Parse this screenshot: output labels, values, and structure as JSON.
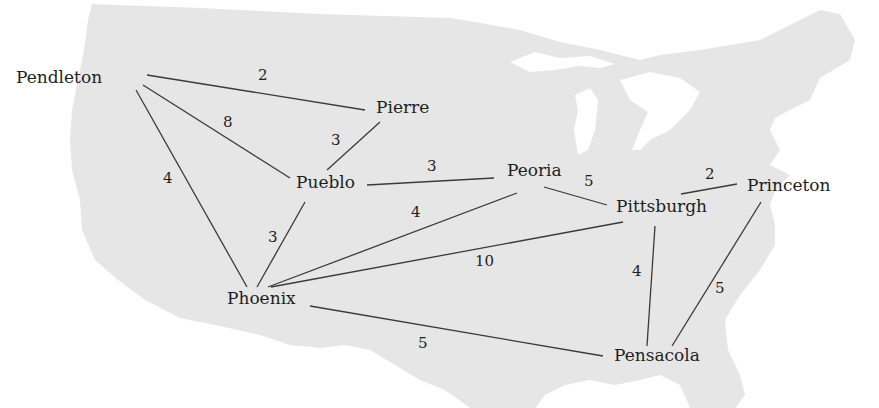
{
  "diagram": {
    "type": "weighted-undirected-graph",
    "background": "US map silhouette",
    "colors": {
      "map_fill": "#e6e6e6",
      "edge": "#3a3a3a",
      "text": "#1e1e1e",
      "background": "#ffffff"
    },
    "nodes": [
      {
        "id": "pendleton",
        "label": "Pendleton",
        "x": 16,
        "y": 69
      },
      {
        "id": "pierre",
        "label": "Pierre",
        "x": 376,
        "y": 99
      },
      {
        "id": "pueblo",
        "label": "Pueblo",
        "x": 296,
        "y": 174
      },
      {
        "id": "peoria",
        "label": "Peoria",
        "x": 507,
        "y": 162
      },
      {
        "id": "pittsburgh",
        "label": "Pittsburgh",
        "x": 616,
        "y": 198
      },
      {
        "id": "princeton",
        "label": "Princeton",
        "x": 747,
        "y": 177
      },
      {
        "id": "phoenix",
        "label": "Phoenix",
        "x": 227,
        "y": 290
      },
      {
        "id": "pensacola",
        "label": "Pensacola",
        "x": 614,
        "y": 347
      }
    ],
    "edges": [
      {
        "from": "pendleton",
        "to": "pierre",
        "weight": "2",
        "x1": 147,
        "y1": 75,
        "x2": 365,
        "y2": 110,
        "lx": 258,
        "ly": 68
      },
      {
        "from": "pendleton",
        "to": "pueblo",
        "weight": "8",
        "x1": 143,
        "y1": 85,
        "x2": 290,
        "y2": 178,
        "lx": 223,
        "ly": 115
      },
      {
        "from": "pendleton",
        "to": "phoenix",
        "weight": "4",
        "x1": 136,
        "y1": 90,
        "x2": 247,
        "y2": 287,
        "lx": 163,
        "ly": 171
      },
      {
        "from": "pierre",
        "to": "pueblo",
        "weight": "3",
        "x1": 380,
        "y1": 122,
        "x2": 327,
        "y2": 170,
        "lx": 331,
        "ly": 133
      },
      {
        "from": "pueblo",
        "to": "peoria",
        "weight": "3",
        "x1": 367,
        "y1": 185,
        "x2": 494,
        "y2": 178,
        "lx": 427,
        "ly": 159
      },
      {
        "from": "pueblo",
        "to": "phoenix",
        "weight": "3",
        "x1": 305,
        "y1": 202,
        "x2": 257,
        "y2": 287,
        "lx": 268,
        "ly": 230
      },
      {
        "from": "peoria",
        "to": "pittsburgh",
        "weight": "5",
        "x1": 544,
        "y1": 187,
        "x2": 607,
        "y2": 205,
        "lx": 584,
        "ly": 174
      },
      {
        "from": "peoria",
        "to": "phoenix",
        "weight": "4",
        "x1": 517,
        "y1": 193,
        "x2": 268,
        "y2": 287,
        "lx": 411,
        "ly": 205
      },
      {
        "from": "pittsburgh",
        "to": "phoenix",
        "weight": "10",
        "x1": 623,
        "y1": 222,
        "x2": 271,
        "y2": 287,
        "lx": 475,
        "ly": 254
      },
      {
        "from": "pittsburgh",
        "to": "princeton",
        "weight": "2",
        "x1": 681,
        "y1": 194,
        "x2": 737,
        "y2": 184,
        "lx": 705,
        "ly": 167
      },
      {
        "from": "pittsburgh",
        "to": "pensacola",
        "weight": "4",
        "x1": 655,
        "y1": 226,
        "x2": 647,
        "y2": 346,
        "lx": 632,
        "ly": 264
      },
      {
        "from": "princeton",
        "to": "pensacola",
        "weight": "5",
        "x1": 761,
        "y1": 202,
        "x2": 672,
        "y2": 346,
        "lx": 715,
        "ly": 281
      },
      {
        "from": "phoenix",
        "to": "pensacola",
        "weight": "5",
        "x1": 310,
        "y1": 306,
        "x2": 603,
        "y2": 356,
        "lx": 418,
        "ly": 336
      }
    ]
  }
}
